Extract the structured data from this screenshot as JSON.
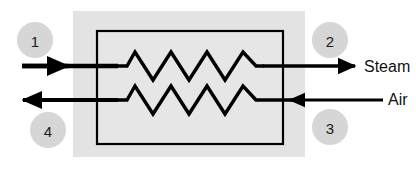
{
  "diagram": {
    "type": "process-flow-heat-exchanger",
    "colors": {
      "panel_background": "#e3e3e3",
      "exchanger_fill": "#e3e3e3",
      "exchanger_border": "#000000",
      "line": "#000000",
      "node_circle_fill": "#d6d6d6",
      "node_text": "#1a1a1a",
      "label_text": "#111111",
      "page_background": "#ffffff"
    },
    "panel": {
      "x": 73,
      "y": 11,
      "width": 232,
      "height": 146
    },
    "exchanger_box": {
      "x": 97,
      "y": 31,
      "width": 186,
      "height": 113,
      "border_width": 2
    },
    "coils": [
      {
        "name": "steam-coil",
        "y": 66,
        "start_x": 117,
        "end_x": 263,
        "peaks": 4,
        "amplitude": 14
      },
      {
        "name": "air-coil",
        "y": 100,
        "start_x": 117,
        "end_x": 263,
        "peaks": 4,
        "amplitude": 14
      }
    ],
    "streams": [
      {
        "id": "steam-inlet",
        "node": "1",
        "direction": "right",
        "y": 66,
        "from_x": 22,
        "to_x": 117,
        "label": ""
      },
      {
        "id": "steam-outlet",
        "node": "2",
        "direction": "right",
        "y": 66,
        "from_x": 263,
        "to_x": 357,
        "label": "Steam"
      },
      {
        "id": "air-outlet",
        "node": "4",
        "direction": "left",
        "y": 100,
        "from_x": 117,
        "to_x": 20,
        "label": ""
      },
      {
        "id": "air-inlet",
        "node": "3",
        "direction": "left",
        "y": 100,
        "from_x": 383,
        "to_x": 287,
        "label": "Air"
      }
    ],
    "nodes": [
      {
        "id": "node-1",
        "number": "1",
        "cx": 35,
        "cy": 40,
        "r": 18
      },
      {
        "id": "node-2",
        "number": "2",
        "cx": 330,
        "cy": 40,
        "r": 18
      },
      {
        "id": "node-3",
        "number": "3",
        "cx": 330,
        "cy": 127,
        "r": 18
      },
      {
        "id": "node-4",
        "number": "4",
        "cx": 48,
        "cy": 130,
        "r": 18
      }
    ],
    "labels": [
      {
        "id": "label-steam",
        "text": "Steam",
        "x": 364,
        "y": 66
      },
      {
        "id": "label-air",
        "text": "Air",
        "x": 390,
        "y": 99
      }
    ]
  }
}
